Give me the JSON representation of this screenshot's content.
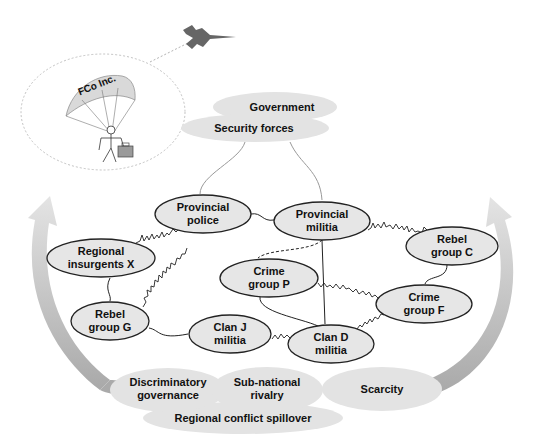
{
  "diagram": {
    "external_actor": {
      "label": "FCo Inc.",
      "icons": [
        "airplane-icon",
        "parachute-icon",
        "stick-figure-icon",
        "briefcase-icon"
      ]
    },
    "top_clouds": [
      {
        "id": "government",
        "label": "Government"
      },
      {
        "id": "security_forces",
        "label": "Security forces"
      }
    ],
    "nodes": [
      {
        "id": "provincial_police",
        "line1": "Provincial",
        "line2": "police"
      },
      {
        "id": "provincial_militia",
        "line1": "Provincial",
        "line2": "militia"
      },
      {
        "id": "regional_insurgents_x",
        "line1": "Regional",
        "line2": "insurgents X"
      },
      {
        "id": "rebel_group_c",
        "line1": "Rebel",
        "line2": "group C"
      },
      {
        "id": "crime_group_p",
        "line1": "Crime",
        "line2": "group P"
      },
      {
        "id": "crime_group_f",
        "line1": "Crime",
        "line2": "group F"
      },
      {
        "id": "rebel_group_g",
        "line1": "Rebel",
        "line2": "group G"
      },
      {
        "id": "clan_j_militia",
        "line1": "Clan J",
        "line2": "militia"
      },
      {
        "id": "clan_d_militia",
        "line1": "Clan D",
        "line2": "militia"
      }
    ],
    "bottom_clouds": [
      {
        "id": "discriminatory_governance",
        "line1": "Discriminatory",
        "line2": "governance"
      },
      {
        "id": "subnational_rivalry",
        "line1": "Sub-national",
        "line2": "rivalry"
      },
      {
        "id": "scarcity",
        "line1": "Scarcity",
        "line2": ""
      },
      {
        "id": "regional_conflict_spillover",
        "line1": "Regional conflict spillover",
        "line2": ""
      }
    ],
    "edges": [
      {
        "from": "security_forces",
        "to": "provincial_police",
        "type": "weak"
      },
      {
        "from": "security_forces",
        "to": "provincial_militia",
        "type": "weak"
      },
      {
        "from": "provincial_police",
        "to": "provincial_militia",
        "type": "cooperative"
      },
      {
        "from": "provincial_police",
        "to": "regional_insurgents_x",
        "type": "conflict"
      },
      {
        "from": "provincial_police",
        "to": "rebel_group_g",
        "type": "conflict"
      },
      {
        "from": "provincial_militia",
        "to": "rebel_group_c",
        "type": "conflict"
      },
      {
        "from": "provincial_militia",
        "to": "crime_group_p",
        "type": "dashed"
      },
      {
        "from": "provincial_militia",
        "to": "clan_d_militia",
        "type": "cooperative"
      },
      {
        "from": "regional_insurgents_x",
        "to": "rebel_group_g",
        "type": "cooperative"
      },
      {
        "from": "rebel_group_c",
        "to": "crime_group_f",
        "type": "cooperative"
      },
      {
        "from": "crime_group_p",
        "to": "crime_group_f",
        "type": "conflict"
      },
      {
        "from": "crime_group_p",
        "to": "clan_d_militia",
        "type": "cooperative"
      },
      {
        "from": "rebel_group_g",
        "to": "clan_j_militia",
        "type": "cooperative"
      },
      {
        "from": "clan_j_militia",
        "to": "clan_d_militia",
        "type": "conflict"
      },
      {
        "from": "clan_d_militia",
        "to": "crime_group_f",
        "type": "conflict"
      }
    ],
    "colors": {
      "node_fill": "#e6e6e6",
      "cloud_fill": "#e3e3e3",
      "arrow_fill": "#c8c8c8",
      "plane": "#666666",
      "stroke": "#222222"
    }
  }
}
